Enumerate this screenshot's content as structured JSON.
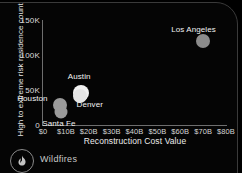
{
  "footer": {
    "icon": "flame-icon",
    "label": "Wildfires"
  },
  "chart_data": {
    "type": "scatter",
    "title": "",
    "xlabel": "Reconstruction Cost Value",
    "ylabel": "High to extreme risk residence count",
    "xlim": [
      0,
      80
    ],
    "ylim": [
      0,
      150000
    ],
    "grid": false,
    "legend": "none",
    "xtick_labels": [
      "$0",
      "$10B",
      "$20B",
      "$30B",
      "$40B",
      "$50B",
      "$60B",
      "$70B",
      "$80B"
    ],
    "xtick_values": [
      0,
      10,
      20,
      30,
      40,
      50,
      60,
      70,
      80
    ],
    "ytick_labels": [
      "0",
      "50K",
      "100K",
      "150K"
    ],
    "ytick_values": [
      0,
      50000,
      100000,
      150000
    ],
    "points": [
      {
        "name": "Los Angeles",
        "x": 70.0,
        "y": 120000,
        "size": 7,
        "color": "#8c8c8c",
        "label_dx": -32,
        "label_dy": -16
      },
      {
        "name": "Austin",
        "x": 16.5,
        "y": 46000,
        "size": 8,
        "color": "#f2f2f2",
        "label_dx": -13,
        "label_dy": -21
      },
      {
        "name": "Denver",
        "x": 16.0,
        "y": 42000,
        "size": 7,
        "color": "#e6e6e6",
        "label_dx": -3,
        "label_dy": 4
      },
      {
        "name": "Houston",
        "x": 7.5,
        "y": 28000,
        "size": 7,
        "color": "#9a9a9a",
        "label_dx": -43,
        "label_dy": -11
      },
      {
        "name": "Santa Fe",
        "x": 8.0,
        "y": 19000,
        "size": 6.5,
        "color": "#9a9a9a",
        "label_dx": -19,
        "label_dy": 7
      }
    ]
  }
}
